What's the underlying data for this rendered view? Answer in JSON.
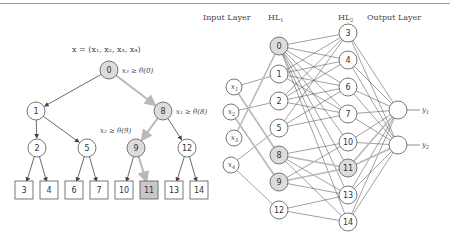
{
  "tree": {
    "formula": "x = (x₁, x₂, x₃, x₄)",
    "split_labels": {
      "n0": "x₃ ≥ θ(0)",
      "n8": "x₁ ≥ θ(8)",
      "n9": "x₂ ≥ θ(9)"
    },
    "internal_nodes": [
      {
        "id": "0",
        "x": 109,
        "y": 70,
        "highlight": true
      },
      {
        "id": "1",
        "x": 36,
        "y": 111,
        "highlight": false
      },
      {
        "id": "8",
        "x": 163,
        "y": 111,
        "highlight": true
      },
      {
        "id": "2",
        "x": 37,
        "y": 148,
        "highlight": false
      },
      {
        "id": "5",
        "x": 87,
        "y": 148,
        "highlight": false
      },
      {
        "id": "9",
        "x": 136,
        "y": 148,
        "highlight": true
      },
      {
        "id": "12",
        "x": 187,
        "y": 148,
        "highlight": false
      }
    ],
    "leaves": [
      {
        "id": "3",
        "x": 24,
        "y": 190,
        "highlight": false
      },
      {
        "id": "4",
        "x": 49,
        "y": 190,
        "highlight": false
      },
      {
        "id": "6",
        "x": 74,
        "y": 190,
        "highlight": false
      },
      {
        "id": "7",
        "x": 99,
        "y": 190,
        "highlight": false
      },
      {
        "id": "10",
        "x": 124,
        "y": 190,
        "highlight": false
      },
      {
        "id": "11",
        "x": 149,
        "y": 190,
        "highlight": true
      },
      {
        "id": "13",
        "x": 174,
        "y": 190,
        "highlight": false
      },
      {
        "id": "14",
        "x": 199,
        "y": 190,
        "highlight": false
      }
    ],
    "edges": [
      [
        "0",
        "1",
        false
      ],
      [
        "0",
        "8",
        true
      ],
      [
        "1",
        "2",
        false
      ],
      [
        "1",
        "5",
        false
      ],
      [
        "8",
        "9",
        true
      ],
      [
        "8",
        "12",
        false
      ],
      [
        "2",
        "3",
        false
      ],
      [
        "2",
        "4",
        false
      ],
      [
        "5",
        "6",
        false
      ],
      [
        "5",
        "7",
        false
      ],
      [
        "9",
        "10",
        false
      ],
      [
        "9",
        "11",
        true
      ],
      [
        "12",
        "13",
        false
      ],
      [
        "12",
        "14",
        false
      ]
    ]
  },
  "network": {
    "layer_labels": {
      "input": "Input Layer",
      "hl1": "HL",
      "hl1_sub": "1",
      "hl2": "HL",
      "hl2_sub": "2",
      "output": "Output Layer"
    },
    "inputs": [
      {
        "id": "x1",
        "label": "x",
        "sub": "1",
        "x": 234,
        "y": 87
      },
      {
        "id": "x2",
        "label": "x",
        "sub": "2",
        "x": 231,
        "y": 112
      },
      {
        "id": "x3",
        "label": "x",
        "sub": "3",
        "x": 234,
        "y": 138
      },
      {
        "id": "x4",
        "label": "x",
        "sub": "4",
        "x": 231,
        "y": 165
      }
    ],
    "hl1": [
      {
        "id": "0",
        "x": 279,
        "y": 46,
        "highlight": true
      },
      {
        "id": "1",
        "x": 279,
        "y": 74,
        "highlight": false
      },
      {
        "id": "2",
        "x": 279,
        "y": 101,
        "highlight": false
      },
      {
        "id": "5",
        "x": 279,
        "y": 128,
        "highlight": false
      },
      {
        "id": "8",
        "x": 279,
        "y": 155,
        "highlight": true
      },
      {
        "id": "9",
        "x": 279,
        "y": 182,
        "highlight": true
      },
      {
        "id": "12",
        "x": 279,
        "y": 210,
        "highlight": false
      }
    ],
    "hl2": [
      {
        "id": "3",
        "x": 348,
        "y": 33,
        "highlight": false
      },
      {
        "id": "4",
        "x": 348,
        "y": 60,
        "highlight": false
      },
      {
        "id": "6",
        "x": 348,
        "y": 87,
        "highlight": false
      },
      {
        "id": "7",
        "x": 348,
        "y": 114,
        "highlight": false
      },
      {
        "id": "10",
        "x": 348,
        "y": 142,
        "highlight": false
      },
      {
        "id": "11",
        "x": 348,
        "y": 168,
        "highlight": true
      },
      {
        "id": "13",
        "x": 348,
        "y": 195,
        "highlight": false
      },
      {
        "id": "14",
        "x": 348,
        "y": 222,
        "highlight": false
      }
    ],
    "outputs": [
      {
        "id": "y1",
        "label": "y",
        "sub": "1",
        "x": 398,
        "y": 110
      },
      {
        "id": "y2",
        "label": "y",
        "sub": "2",
        "x": 398,
        "y": 145
      }
    ]
  },
  "colors": {
    "node_fill": "#ffffff",
    "highlight_fill": "#dcdcdc",
    "leaf_highlight_fill": "#c8c8c8",
    "stroke": "#555555",
    "edge": "#444444",
    "highlight_edge": "#b8b8b8"
  }
}
